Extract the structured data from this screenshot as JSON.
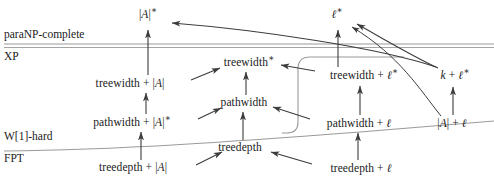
{
  "diagram": {
    "title_hidden": "parameterized complexity hierarchy of graph width parameters",
    "class_labels": [
      {
        "id": "paranp",
        "text": "paraNP-complete",
        "x": 4,
        "y": 35
      },
      {
        "id": "xp",
        "text": "XP",
        "x": 4,
        "y": 57
      },
      {
        "id": "w1hard",
        "text": "W[1]-hard",
        "x": 4,
        "y": 137
      },
      {
        "id": "fpt",
        "text": "FPT",
        "x": 4,
        "y": 159
      }
    ],
    "nodes": [
      {
        "id": "abs-a-star",
        "label": "|A|*",
        "x": 148,
        "y": 15
      },
      {
        "id": "ell-star",
        "label": "ℓ*",
        "x": 337,
        "y": 15
      },
      {
        "id": "treewidth-star",
        "label": "treewidth*",
        "x": 249,
        "y": 63
      },
      {
        "id": "treewidth-abs-a",
        "label": "treewidth + |A|",
        "x": 130,
        "y": 84
      },
      {
        "id": "treewidth-ell-star",
        "label": "treewidth + ℓ*",
        "x": 364,
        "y": 76
      },
      {
        "id": "k-plus-ell-star",
        "label": "k + ℓ*",
        "x": 455,
        "y": 76
      },
      {
        "id": "pathwidth",
        "label": "pathwidth",
        "x": 244,
        "y": 103
      },
      {
        "id": "pathwidth-abs-a",
        "label": "pathwidth + |A|*",
        "x": 132,
        "y": 123
      },
      {
        "id": "pathwidth-ell",
        "label": "pathwidth + ℓ",
        "x": 359,
        "y": 124
      },
      {
        "id": "abs-a-plus-ell",
        "label": "|A| + ℓ",
        "x": 452,
        "y": 124
      },
      {
        "id": "treedepth",
        "label": "treedepth",
        "x": 240,
        "y": 148
      },
      {
        "id": "treedepth-abs-a",
        "label": "treedepth + |A|",
        "x": 133,
        "y": 168
      },
      {
        "id": "treedepth-ell",
        "label": "treedepth + ℓ",
        "x": 361,
        "y": 169
      }
    ],
    "colors": {
      "arrow": "#3c3c3c",
      "divider": "#9a9a9a",
      "bracket": "#9a9a9a",
      "text": "#1a1a1a",
      "background": "#ffffff"
    },
    "dividers": [
      {
        "id": "paranp-xp-divider",
        "label": "paraNP / XP boundary"
      },
      {
        "id": "w1hard-fpt-divider",
        "label": "W[1]-hard / FPT boundary"
      }
    ]
  }
}
